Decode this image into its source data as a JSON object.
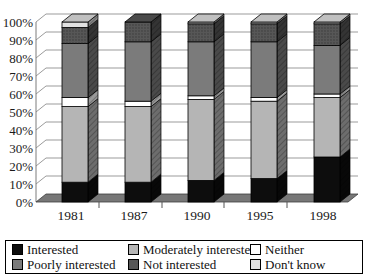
{
  "chart_data": {
    "type": "bar",
    "subtype": "3d-stacked-percent-column",
    "title": "",
    "xlabel": "",
    "ylabel": "",
    "ylim": [
      0,
      100
    ],
    "grid": true,
    "legend_position": "bottom",
    "categories": [
      "1981",
      "1987",
      "1990",
      "1995",
      "1998"
    ],
    "y_tick_labels": [
      "0%",
      "10%",
      "20%",
      "30%",
      "40%",
      "50%",
      "60%",
      "70%",
      "80%",
      "90%",
      "100%"
    ],
    "series": [
      {
        "name": "Interested",
        "color": "#0d0d0d",
        "values": [
          11,
          11,
          12,
          13,
          25
        ]
      },
      {
        "name": "Moderately interested",
        "color": "#b5b5b5",
        "values": [
          42,
          42,
          45,
          43,
          33
        ]
      },
      {
        "name": "Neither",
        "color": "#ffffff",
        "values": [
          5,
          3,
          2,
          2,
          2
        ]
      },
      {
        "name": "Poorly interested",
        "color": "#7b7b7b",
        "values": [
          30,
          33,
          30,
          31,
          27
        ]
      },
      {
        "name": "Not interested",
        "color": "#575757",
        "values": [
          9,
          11,
          10,
          10,
          12
        ]
      },
      {
        "name": "Don't know",
        "color": "#e2e2e2",
        "values": [
          3,
          0,
          1,
          1,
          1
        ]
      }
    ],
    "colors": {
      "floor": "#777777",
      "gridline": "#9b9b9b",
      "axis_line": "#7d7d7d",
      "outline": "#000000"
    }
  }
}
